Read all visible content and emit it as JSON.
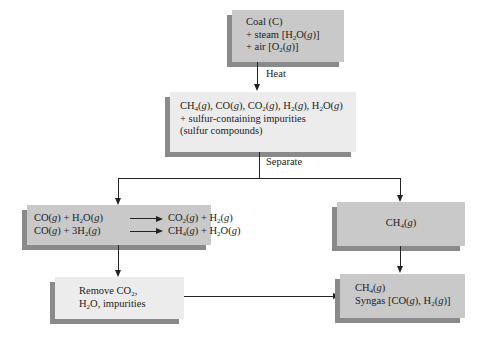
{
  "diagram": {
    "nodes": {
      "coal_input": {
        "lines": [
          "Coal (C)",
          "+ steam [H2O(g)]",
          "+ air [O2(g)]"
        ]
      },
      "raw_gas": {
        "lines": [
          "CH4(g), CO(g), CO2(g), H2(g), H2O(g)",
          "+ sulfur-containing impurities",
          "(sulfur compounds)"
        ]
      },
      "shift_reactions": {
        "reactions": [
          {
            "reactants": "CO(g) + H2O(g)",
            "products": "CO2(g) + H2(g)"
          },
          {
            "reactants": "CO(g) + 3H2(g)",
            "products": "CH4(g) + H2O(g)"
          }
        ]
      },
      "methane": {
        "lines": [
          "CH4(g)"
        ]
      },
      "removal": {
        "lines": [
          "Remove CO2,",
          "H2O, impurities"
        ]
      },
      "product": {
        "lines": [
          "CH4(g)",
          "Syngas [CO(g), H2(g)]"
        ]
      }
    },
    "edges": [
      {
        "from": "coal_input",
        "to": "raw_gas",
        "label": "Heat"
      },
      {
        "from": "raw_gas",
        "to": "shift_reactions",
        "label": "Separate"
      },
      {
        "from": "raw_gas",
        "to": "methane",
        "label": "Separate"
      },
      {
        "from": "shift_reactions",
        "to": "removal",
        "label": ""
      },
      {
        "from": "methane",
        "to": "product",
        "label": ""
      },
      {
        "from": "removal",
        "to": "product",
        "label": ""
      }
    ],
    "labels": {
      "heat": "Heat",
      "separate": "Separate"
    },
    "colors": {
      "dark_box": "#c9c9c9",
      "light_box": "#ececec",
      "shadow": "#8a8a8a",
      "line": "#222222"
    }
  }
}
